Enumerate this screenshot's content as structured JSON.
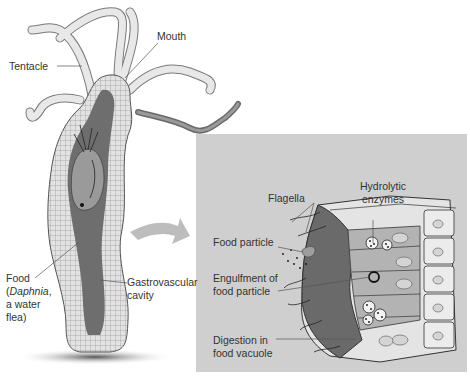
{
  "figure": {
    "left_panel": {
      "subject": "Hydra (cnidarian) body, longitudinal section",
      "labels": {
        "tentacle": "Tentacle",
        "mouth": "Mouth",
        "food_line1": "Food",
        "food_line2_open": "(",
        "food_line2_italic": "Daphnia",
        "food_line2_close": ",",
        "food_line3": "a water",
        "food_line4": "flea)",
        "gastro_line1": "Gastrovascular",
        "gastro_line2": "cavity"
      }
    },
    "right_panel": {
      "subject": "Gastrodermis cells lining the gastrovascular cavity",
      "labels": {
        "hydrolytic_line1": "Hydrolytic",
        "hydrolytic_line2": "enzymes",
        "flagella": "Flagella",
        "food_particle": "Food particle",
        "engulfment_line1": "Engulfment of",
        "engulfment_line2": "food particle",
        "digestion_line1": "Digestion in",
        "digestion_line2": "food vacuole"
      }
    },
    "colors": {
      "panel_bg": "#cfcfcf",
      "cavity_dark": "#6e6e6e",
      "tissue_light": "#e4e4e4",
      "tentacle_fill": "#e6e6e6",
      "arrow": "#bdbdbd",
      "text": "#333333"
    }
  }
}
